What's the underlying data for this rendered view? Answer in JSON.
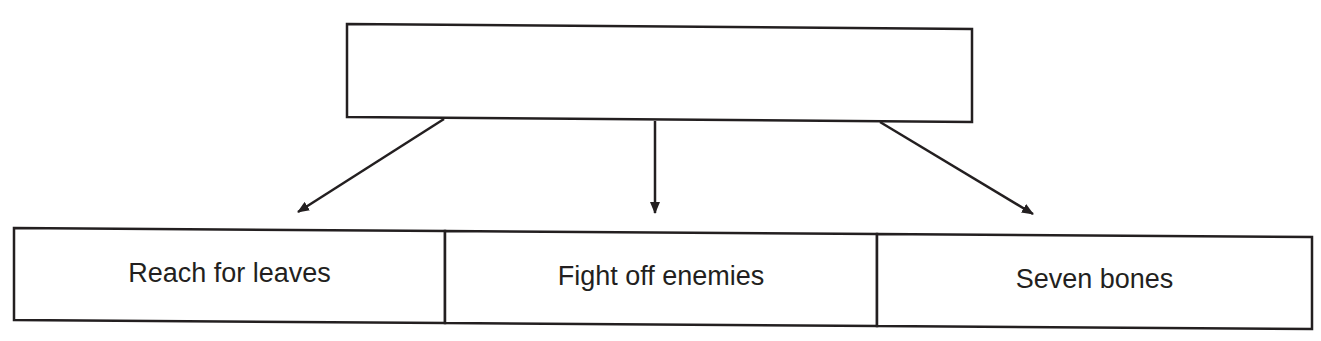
{
  "diagram": {
    "top_box": {
      "text": ""
    },
    "bottom_boxes": [
      {
        "text": "Reach for leaves"
      },
      {
        "text": "Fight off enemies"
      },
      {
        "text": "Seven bones"
      }
    ],
    "stroke_color": "#231f20"
  }
}
